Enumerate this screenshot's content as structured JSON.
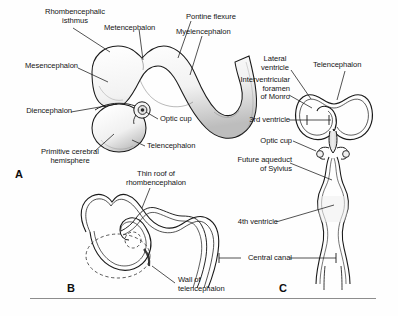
{
  "figure": {
    "background_color": "#fefefe",
    "ink_color": "#141414",
    "rule_color": "#8d8d8d"
  },
  "panels": [
    {
      "id": "A",
      "letter": "A",
      "caption": "Lateral view of the embryonic brain vesicles",
      "labels": [
        {
          "name": "rhombencephalic-isthmus",
          "text": "Rhombencephalic\nisthmus"
        },
        {
          "name": "metencephalon",
          "text": "Metencephalon"
        },
        {
          "name": "pontine-flexure",
          "text": "Pontine flexure"
        },
        {
          "name": "myelencephalon",
          "text": "Myelencephalon"
        },
        {
          "name": "mesencephalon",
          "text": "Mesencephalon"
        },
        {
          "name": "diencephalon",
          "text": "Diencephalon"
        },
        {
          "name": "optic-cup",
          "text": "Optic cup"
        },
        {
          "name": "telencephalon",
          "text": "Telencephalon"
        },
        {
          "name": "primitive-cerebral-hemisphere",
          "text": "Primitive cerebral\nhemisphere"
        }
      ]
    },
    {
      "id": "B",
      "letter": "B",
      "caption": "Midline section showing the neural tube wall and roof",
      "labels": [
        {
          "name": "thin-roof-of-rhombencephalon",
          "text": "Thin roof of\nrhombencephalon"
        },
        {
          "name": "wall-of-telencephalon",
          "text": "Wall of\ntelencephalon"
        }
      ]
    },
    {
      "id": "C",
      "letter": "C",
      "caption": "Frontal view of the developing ventricular system",
      "labels": [
        {
          "name": "lateral-ventricle",
          "text": "Lateral\nventricle"
        },
        {
          "name": "telencephalon",
          "text": "Telencephalon"
        },
        {
          "name": "interventricular-foramen-of-monro",
          "text": "Interventricular\nforamen\nof Monro"
        },
        {
          "name": "third-ventricle",
          "text": "3rd ventricle"
        },
        {
          "name": "optic-cup",
          "text": "Optic cup"
        },
        {
          "name": "future-aqueduct-of-sylvius",
          "text": "Future aqueduct\nof Sylvius"
        },
        {
          "name": "fourth-ventricle",
          "text": "4th ventricle"
        },
        {
          "name": "central-canal",
          "text": "Central canal"
        }
      ]
    }
  ]
}
